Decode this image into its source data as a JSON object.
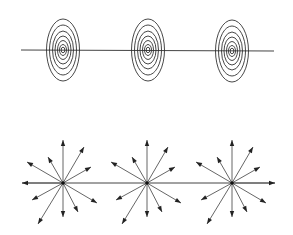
{
  "diagram": {
    "width": 293,
    "height": 235,
    "colors": {
      "background": "#ffffff",
      "line": "#444444",
      "ring": "#333333",
      "ray": "#555555",
      "arrow": "#222222",
      "dot": "#111111"
    },
    "top_panel": {
      "name": "concentric-ellipse-row",
      "line": {
        "x1": 21,
        "y1": 50,
        "x2": 274,
        "y2": 51
      },
      "groups": [
        {
          "cx": 63,
          "cy": 50
        },
        {
          "cx": 148,
          "cy": 50
        },
        {
          "cx": 232,
          "cy": 51
        }
      ],
      "rings": [
        {
          "rx": 16.5,
          "ry": 31
        },
        {
          "rx": 13.5,
          "ry": 25
        },
        {
          "rx": 10.5,
          "ry": 19
        },
        {
          "rx": 8,
          "ry": 14
        },
        {
          "rx": 5.5,
          "ry": 9.5
        },
        {
          "rx": 3.5,
          "ry": 5.5
        },
        {
          "rx": 1.8,
          "ry": 2.8
        }
      ]
    },
    "bottom_panel": {
      "name": "radial-arrow-row",
      "line": {
        "x1": 22,
        "y1": 183,
        "x2": 275,
        "y2": 183
      },
      "sources": [
        {
          "cx": 63,
          "cy": 183,
          "left_arrow": true,
          "right_arrow": false
        },
        {
          "cx": 147,
          "cy": 183,
          "left_arrow": false,
          "right_arrow": false
        },
        {
          "cx": 232,
          "cy": 183,
          "left_arrow": false,
          "right_arrow": true
        }
      ],
      "rays": [
        {
          "dx": 0,
          "dy": -43
        },
        {
          "dx": 21,
          "dy": -36
        },
        {
          "dx": -15,
          "dy": -26
        },
        {
          "dx": -36,
          "dy": -21
        },
        {
          "dx": 28,
          "dy": -16
        },
        {
          "dx": -31,
          "dy": 17
        },
        {
          "dx": 34,
          "dy": 20
        },
        {
          "dx": 15,
          "dy": 29
        },
        {
          "dx": 0,
          "dy": 34
        },
        {
          "dx": -25,
          "dy": 41
        }
      ],
      "horizontal_arrow_length": 41
    }
  }
}
